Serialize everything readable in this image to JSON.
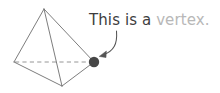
{
  "canvas": {
    "width": 220,
    "height": 93,
    "background": "#ffffff"
  },
  "annotation": {
    "label_primary": "This is a ",
    "label_highlight": "vertex.",
    "full_text": "This is a vertex.",
    "primary_color": "#3d3d3d",
    "highlight_color": "#b8b8b8"
  },
  "diagram": {
    "name": "tetrahedron",
    "stroke_color": "#6e6e6e",
    "hidden_edge_color": "#8a8a8a",
    "marker_color": "#474747",
    "arrow_color": "#555555",
    "vertices": [
      {
        "id": "apex",
        "x": 44,
        "y": 9,
        "label": "apex"
      },
      {
        "id": "left",
        "x": 14,
        "y": 62,
        "label": "left-rear"
      },
      {
        "id": "right",
        "x": 94,
        "y": 62,
        "label": "right-rear"
      },
      {
        "id": "front",
        "x": 62,
        "y": 86,
        "label": "front-base"
      }
    ],
    "edges": [
      {
        "from": "apex",
        "to": "left",
        "style": "solid"
      },
      {
        "from": "apex",
        "to": "right",
        "style": "solid"
      },
      {
        "from": "apex",
        "to": "front",
        "style": "solid"
      },
      {
        "from": "left",
        "to": "front",
        "style": "solid"
      },
      {
        "from": "right",
        "to": "front",
        "style": "solid"
      },
      {
        "from": "left",
        "to": "right",
        "style": "dashed"
      }
    ],
    "marker": {
      "id": "vertex-dot",
      "x": 94,
      "y": 62,
      "radius": 5.2
    },
    "arrow": {
      "start_x": 116,
      "start_y": 31,
      "end_x": 100,
      "end_y": 55,
      "control_x": 117,
      "control_y": 50
    }
  }
}
